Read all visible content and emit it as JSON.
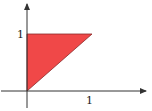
{
  "diagram": {
    "fill_color": "#f04848",
    "edge_color": "#8a2a2a",
    "axis_color": "#333333",
    "region_vertices": [
      [
        0,
        0
      ],
      [
        0,
        1
      ],
      [
        1,
        1
      ]
    ],
    "x_axis": {
      "tick_label": "1"
    },
    "y_axis": {
      "tick_label": "1"
    }
  }
}
